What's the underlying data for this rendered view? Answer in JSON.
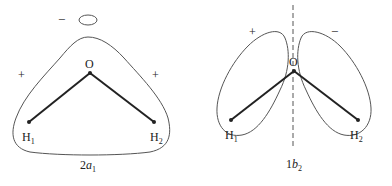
{
  "diagrams": [
    {
      "id": "2a1",
      "caption_main": "2",
      "caption_italic": "a",
      "caption_sub": "1",
      "atoms": {
        "center": "O",
        "left": "H",
        "left_sub": "1",
        "right": "H",
        "right_sub": "2"
      },
      "signs": {
        "left": "+",
        "right": "+",
        "top": "−"
      }
    },
    {
      "id": "1b2",
      "caption_main": "1",
      "caption_italic": "b",
      "caption_sub": "2",
      "atoms": {
        "center": "O",
        "left": "H",
        "left_sub": "1",
        "right": "H",
        "right_sub": "2"
      },
      "signs": {
        "left": "+",
        "right": "−"
      }
    }
  ],
  "colors": {
    "line": "#222222",
    "contour": "#555555"
  }
}
